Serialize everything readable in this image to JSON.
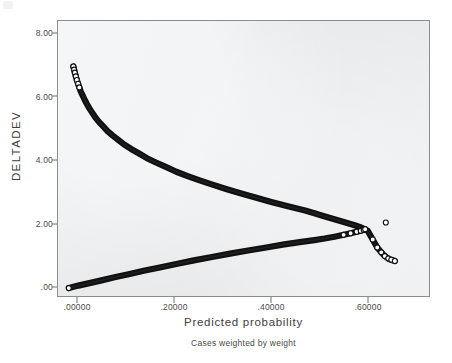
{
  "footnote": "Cases weighted by weight",
  "axes": {
    "y_title": "DELTADEV",
    "x_title": "Predicted probability",
    "y_ticks": [
      "8.00",
      "6.00",
      "4.00",
      "2.00",
      ".00"
    ],
    "y_tick_values": [
      8.0,
      6.0,
      4.0,
      2.0,
      0.0
    ],
    "x_ticks": [
      ".00000",
      ".20000",
      ".40000",
      ".60000"
    ],
    "x_tick_values": [
      0.0,
      0.2,
      0.4,
      0.6
    ]
  },
  "colors": {
    "plot_background": "#e9ebed",
    "page_background": "#ffffff",
    "frame": "#8a8d90",
    "marker_stroke": "#111111",
    "marker_fill": "#ffffff",
    "text": "#3d3d3d"
  },
  "chart_data": {
    "type": "scatter",
    "title": "",
    "subtitle": "Cases weighted by weight",
    "xlabel": "Predicted probability",
    "ylabel": "DELTADEV",
    "xlim": [
      -0.0125,
      0.73
    ],
    "ylim": [
      -0.27,
      8.73
    ],
    "grid": false,
    "legend": null,
    "marker": "open-circle",
    "series": [
      {
        "name": "deviance-residual-event",
        "description": "Descending convex branch: DELTADEV = -2*ln(p) for cases with the event observed",
        "x": [
          0.02,
          0.0215,
          0.023,
          0.025,
          0.027,
          0.0295,
          0.032,
          0.035,
          0.0385,
          0.0425,
          0.047,
          0.052,
          0.0575,
          0.064,
          0.071,
          0.079,
          0.088,
          0.098,
          0.109,
          0.1215,
          0.135,
          0.15,
          0.1665,
          0.1845,
          0.204,
          0.225,
          0.2475,
          0.2715,
          0.297,
          0.324,
          0.3525,
          0.3825,
          0.414,
          0.447,
          0.4815,
          0.5,
          0.5175,
          0.555,
          0.58,
          0.594,
          0.606,
          0.616,
          0.625,
          0.633,
          0.64,
          0.647,
          0.653,
          0.66
        ],
        "y": [
          7.22,
          7.12,
          7.02,
          6.9,
          6.78,
          6.66,
          6.54,
          6.4,
          6.28,
          6.14,
          6.0,
          5.86,
          5.72,
          5.56,
          5.42,
          5.28,
          5.12,
          4.98,
          4.84,
          4.68,
          4.54,
          4.4,
          4.24,
          4.1,
          3.96,
          3.8,
          3.66,
          3.52,
          3.38,
          3.24,
          3.1,
          2.96,
          2.82,
          2.68,
          2.54,
          2.45,
          2.36,
          2.18,
          2.06,
          1.98,
          1.88,
          1.6,
          1.34,
          1.18,
          1.06,
          0.98,
          0.94,
          0.9
        ]
      },
      {
        "name": "deviance-residual-nonevent",
        "description": "Ascending branch: DELTADEV = -2*ln(1-p) for cases without the event",
        "x": [
          0.011,
          0.03,
          0.052,
          0.076,
          0.102,
          0.13,
          0.16,
          0.192,
          0.225,
          0.26,
          0.296,
          0.332,
          0.368,
          0.404,
          0.44,
          0.474,
          0.5,
          0.52,
          0.54,
          0.558,
          0.572,
          0.584,
          0.592,
          0.598,
          0.601
        ],
        "y": [
          0.02,
          0.1,
          0.18,
          0.27,
          0.37,
          0.47,
          0.58,
          0.69,
          0.8,
          0.92,
          1.03,
          1.14,
          1.24,
          1.34,
          1.44,
          1.52,
          1.58,
          1.63,
          1.69,
          1.75,
          1.8,
          1.85,
          1.88,
          1.91,
          1.93
        ]
      },
      {
        "name": "outlier-point",
        "description": "Single isolated open-circle observation above the right end of the ascending branch",
        "x": [
          0.642
        ],
        "y": [
          2.15
        ]
      }
    ]
  }
}
